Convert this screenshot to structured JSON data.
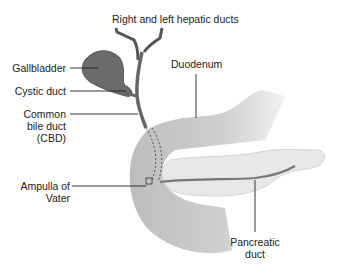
{
  "diagram": {
    "labels": {
      "hepatic_ducts": "Right and left hepatic ducts",
      "gallbladder": "Gallbladder",
      "cystic_duct": "Cystic duct",
      "cbd_line1": "Common",
      "cbd_line2": "bile duct",
      "cbd_line3": "(CBD)",
      "duodenum": "Duodenum",
      "ampulla_line1": "Ampulla of",
      "ampulla_line2": "Vater",
      "pancreatic_line1": "Pancreatic",
      "pancreatic_line2": "duct"
    },
    "colors": {
      "gallbladder": "#6b6b6b",
      "duct": "#666666",
      "duodenum": "#c8c8c8",
      "pancreas": "#e6e6e6",
      "leader_line": "#222222"
    }
  }
}
